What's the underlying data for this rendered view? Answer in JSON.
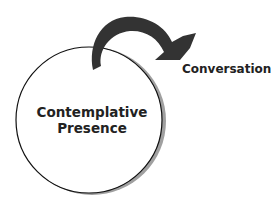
{
  "diagram": {
    "circle_label": [
      "Contemplative",
      "Presence"
    ],
    "arrow_target_label": "Conversation",
    "colors": {
      "arrow": "#333333",
      "circle_stroke": "#111111",
      "shadow": "#999999"
    }
  }
}
